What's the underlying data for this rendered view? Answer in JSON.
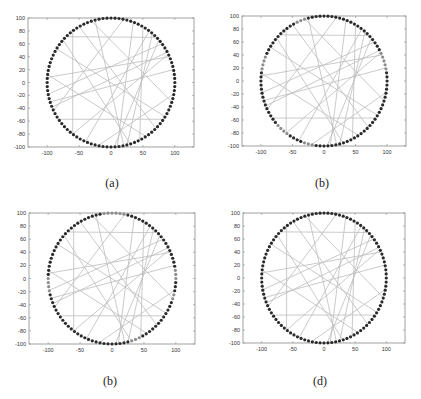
{
  "figure": {
    "captions": [
      "(a)",
      "(b)",
      "(b)",
      "(d)"
    ]
  },
  "style": {
    "axis_color": "#8a8a8a",
    "node_color": "#2a2a2a",
    "edge_color": "#bdbdbd",
    "background": "#ffffff"
  },
  "chart_data": [
    {
      "type": "scatter",
      "title": "",
      "caption": "(a)",
      "xlabel": "",
      "ylabel": "",
      "xlim": [
        -130,
        130
      ],
      "ylim": [
        -100,
        100
      ],
      "xticks": [
        -100,
        -50,
        0,
        50,
        100
      ],
      "yticks": [
        -100,
        -80,
        -60,
        -40,
        -20,
        0,
        20,
        40,
        60,
        80,
        100
      ],
      "grid": false,
      "nodes": {
        "count": 100,
        "center": [
          0,
          0
        ],
        "radius": 100,
        "description": "sensor nodes uniformly placed on a circle of radius 100"
      },
      "edges": [
        [
          [
            -60,
            79
          ],
          [
            -60,
            -79
          ]
        ],
        [
          [
            -70,
            71
          ],
          [
            72,
            70
          ]
        ],
        [
          [
            -82,
            -57
          ],
          [
            82,
            -57
          ]
        ],
        [
          [
            -99,
            8
          ],
          [
            92,
            40
          ]
        ],
        [
          [
            -98,
            -18
          ],
          [
            80,
            60
          ]
        ],
        [
          [
            -95,
            -30
          ],
          [
            98,
            20
          ]
        ],
        [
          [
            -75,
            66
          ],
          [
            30,
            -95
          ]
        ],
        [
          [
            -25,
            97
          ],
          [
            20,
            -98
          ]
        ],
        [
          [
            20,
            98
          ],
          [
            -90,
            -44
          ]
        ],
        [
          [
            35,
            94
          ],
          [
            10,
            -99
          ]
        ],
        [
          [
            60,
            80
          ],
          [
            -40,
            -92
          ]
        ],
        [
          [
            75,
            66
          ],
          [
            5,
            -100
          ]
        ],
        [
          [
            -50,
            87
          ],
          [
            70,
            -71
          ]
        ],
        [
          [
            90,
            44
          ],
          [
            -60,
            -80
          ]
        ],
        [
          [
            -99,
            12
          ],
          [
            55,
            -84
          ]
        ],
        [
          [
            85,
            -53
          ],
          [
            -85,
            52
          ]
        ],
        [
          [
            98,
            -18
          ],
          [
            -20,
            -98
          ]
        ],
        [
          [
            50,
            87
          ],
          [
            45,
            -89
          ]
        ],
        [
          [
            -30,
            95
          ],
          [
            95,
            -30
          ]
        ],
        [
          [
            65,
            76
          ],
          [
            25,
            -97
          ]
        ],
        [
          [
            -92,
            -38
          ],
          [
            88,
            47
          ]
        ]
      ]
    },
    {
      "type": "scatter",
      "title": "",
      "caption": "(b)",
      "xlabel": "",
      "ylabel": "",
      "xlim": [
        -130,
        130
      ],
      "ylim": [
        -100,
        100
      ],
      "xticks": [
        -100,
        -50,
        0,
        50,
        100
      ],
      "yticks": [
        -100,
        -80,
        -60,
        -40,
        -20,
        0,
        20,
        40,
        60,
        80,
        100
      ],
      "grid": false,
      "nodes": {
        "count": 100,
        "center": [
          0,
          0
        ],
        "radius": 100,
        "description": "sensor nodes on circle, some faded (lighter grey)"
      },
      "edges": "same as (a)"
    },
    {
      "type": "scatter",
      "title": "",
      "caption": "(b)",
      "xlabel": "",
      "ylabel": "",
      "xlim": [
        -130,
        130
      ],
      "ylim": [
        -100,
        100
      ],
      "xticks": [
        -100,
        -50,
        0,
        50,
        100
      ],
      "yticks": [
        -100,
        -80,
        -60,
        -40,
        -20,
        0,
        20,
        40,
        60,
        80,
        100
      ],
      "grid": false,
      "nodes": {
        "count": 100,
        "center": [
          0,
          0
        ],
        "radius": 100,
        "description": "sensor nodes on circle, some faded (lighter grey)"
      },
      "edges": "same as (a)"
    },
    {
      "type": "scatter",
      "title": "",
      "caption": "(d)",
      "xlabel": "",
      "ylabel": "",
      "xlim": [
        -130,
        130
      ],
      "ylim": [
        -100,
        100
      ],
      "xticks": [
        -100,
        -50,
        0,
        50,
        100
      ],
      "yticks": [
        -100,
        -80,
        -60,
        -40,
        -20,
        0,
        20,
        40,
        60,
        80,
        100
      ],
      "grid": false,
      "nodes": {
        "count": 100,
        "center": [
          0,
          0
        ],
        "radius": 100,
        "description": "sensor nodes on circle, all dark"
      },
      "edges": "same as (a)"
    }
  ],
  "panels": [
    {
      "left": 28,
      "top": 18,
      "width": 166,
      "height": 129,
      "caption_x": 112,
      "caption_y": 176,
      "faded": []
    },
    {
      "left": 242,
      "top": 16,
      "width": 164,
      "height": 130,
      "caption_x": 322,
      "caption_y": 176,
      "faded": [
        3,
        4,
        5,
        6,
        7,
        30,
        31,
        32,
        44,
        45,
        46,
        47,
        62,
        63,
        64,
        65,
        70,
        71,
        72
      ]
    },
    {
      "left": 29,
      "top": 213,
      "width": 166,
      "height": 131,
      "caption_x": 110,
      "caption_y": 374,
      "faded": [
        0,
        1,
        2,
        22,
        23,
        24,
        25,
        26,
        27,
        50,
        51,
        52,
        53,
        80,
        81,
        82,
        95,
        96
      ]
    },
    {
      "left": 243,
      "top": 213,
      "width": 162,
      "height": 130,
      "caption_x": 320,
      "caption_y": 374,
      "faded": []
    }
  ]
}
